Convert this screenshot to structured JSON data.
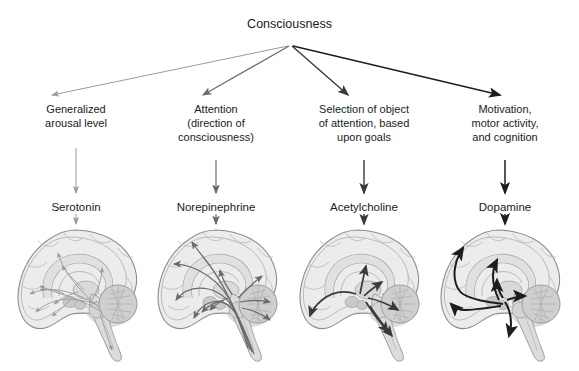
{
  "diagram": {
    "root": {
      "label": "Consciousness"
    },
    "branches": [
      {
        "id": "serotonin",
        "function_label": "Generalized\narousal level",
        "function_lines": [
          "Generalized",
          "arousal level"
        ],
        "neurotransmitter": "Serotonin",
        "brain_caption": "sagittal brain with serotonergic raphe projections",
        "stroke_color": "#9a9a9a",
        "stroke_width": 0.9
      },
      {
        "id": "norepinephrine",
        "function_label": "Attention\n(direction of\nconsciousness)",
        "function_lines": [
          "Attention",
          "(direction of",
          "consciousness)"
        ],
        "neurotransmitter": "Norepinephrine",
        "brain_caption": "sagittal brain with noradrenergic locus coeruleus projections",
        "stroke_color": "#6a6a6a",
        "stroke_width": 1.25
      },
      {
        "id": "acetylcholine",
        "function_label": "Selection of object\nof attention, based\nupon goals",
        "function_lines": [
          "Selection of object",
          "of attention, based",
          "upon goals"
        ],
        "neurotransmitter": "Acetylcholine",
        "brain_caption": "sagittal brain with cholinergic basal forebrain projections",
        "stroke_color": "#3a3a3a",
        "stroke_width": 1.7
      },
      {
        "id": "dopamine",
        "function_label": "Motivation,\nmotor activity,\nand cognition",
        "function_lines": [
          "Motivation,",
          "motor activity,",
          "and cognition"
        ],
        "neurotransmitter": "Dopamine",
        "brain_caption": "sagittal brain with dopaminergic midbrain projections",
        "stroke_color": "#1d1d1d",
        "stroke_width": 2.0
      }
    ],
    "colors": {
      "background": "#ffffff",
      "text": "#1b1b1b",
      "brain_outline": "#8d8d8d",
      "brain_fill": "#ececed",
      "brain_shadow": "#d2d2d3",
      "cerebellum": "#cfcfd0"
    }
  }
}
